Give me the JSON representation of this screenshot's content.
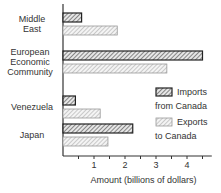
{
  "chart_data": {
    "type": "bar",
    "orientation": "horizontal",
    "title": "",
    "xlabel": "Amount (billions of dollars)",
    "ylabel": "",
    "xlim": [
      0,
      4.8
    ],
    "xticks": [
      1,
      2,
      3,
      4
    ],
    "categories": [
      "Middle East",
      "European Economic Community",
      "Venezuela",
      "Japan"
    ],
    "category_lines": [
      [
        "Middle",
        "East"
      ],
      [
        "European",
        "Economic",
        "Community"
      ],
      [
        "Venezuela"
      ],
      [
        "Japan"
      ]
    ],
    "series": [
      {
        "name": "Imports from Canada",
        "legend_lines": [
          "Imports",
          "from Canada"
        ],
        "values": [
          0.6,
          4.5,
          0.4,
          2.25
        ],
        "style": "dark-hatch"
      },
      {
        "name": "Exports to Canada",
        "legend_lines": [
          "Exports",
          "to Canada"
        ],
        "values": [
          1.75,
          3.35,
          1.2,
          1.45
        ],
        "style": "light-hatch"
      }
    ],
    "grid": false,
    "legend_position": "right-middle"
  }
}
